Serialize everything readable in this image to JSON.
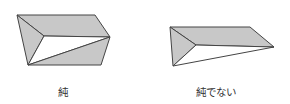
{
  "figures": [
    {
      "id": "pure",
      "label": "純",
      "shaded_color": "#c8c8c8",
      "outline_color": "#444444"
    },
    {
      "id": "not-pure",
      "label": "純でない",
      "shaded_color": "#c8c8c8",
      "outline_color": "#444444"
    }
  ]
}
